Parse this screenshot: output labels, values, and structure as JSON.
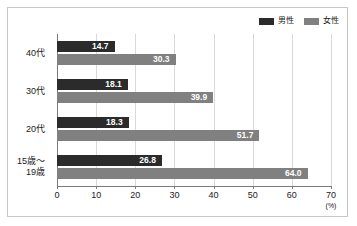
{
  "chart_data": {
    "type": "bar",
    "orientation": "horizontal",
    "title": "",
    "xlabel": "",
    "ylabel": "",
    "unit": "(%)",
    "xlim": [
      0,
      70
    ],
    "xticks": [
      0,
      10,
      20,
      30,
      40,
      50,
      60,
      70
    ],
    "grid": true,
    "legend_position": "top-right",
    "categories": [
      "40代",
      "30代",
      "20代",
      "15歳～\n19歳"
    ],
    "category_lines": [
      [
        "40代"
      ],
      [
        "30代"
      ],
      [
        "20代"
      ],
      [
        "15歳～",
        "19歳"
      ]
    ],
    "series": [
      {
        "name": "男性",
        "color": "#2b2b2b",
        "values": [
          14.7,
          18.1,
          18.3,
          26.8
        ],
        "labels": [
          "14.7",
          "18.1",
          "18.3",
          "26.8"
        ]
      },
      {
        "name": "女性",
        "color": "#808080",
        "values": [
          30.3,
          39.9,
          51.7,
          64.0
        ],
        "labels": [
          "30.3",
          "39.9",
          "51.7",
          "64.0"
        ]
      }
    ]
  },
  "legend": {
    "items": [
      {
        "label": "男性",
        "color": "#2b2b2b"
      },
      {
        "label": "女性",
        "color": "#808080"
      }
    ]
  },
  "axis": {
    "tick_labels": [
      "0",
      "10",
      "20",
      "30",
      "40",
      "50",
      "60",
      "70"
    ],
    "unit": "(%)"
  },
  "colors": {
    "male": "#2b2b2b",
    "female": "#808080",
    "grid": "#d9d9d9",
    "axis": "#7a7a7a",
    "frame": "#c8c8c8",
    "background": "#ffffff",
    "text": "#1a1a1a",
    "label_text": "#ffffff"
  }
}
